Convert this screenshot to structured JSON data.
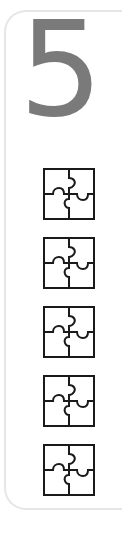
{
  "counter": {
    "value": "5",
    "color": "#7a7a7a"
  },
  "icons": {
    "name": "puzzle-icon",
    "count": 5,
    "stroke_color": "#1a1a1a",
    "items": [
      {
        "label": "puzzle piece 1"
      },
      {
        "label": "puzzle piece 2"
      },
      {
        "label": "puzzle piece 3"
      },
      {
        "label": "puzzle piece 4"
      },
      {
        "label": "puzzle piece 5"
      }
    ]
  },
  "card": {
    "border_color": "#e6e6e6"
  }
}
